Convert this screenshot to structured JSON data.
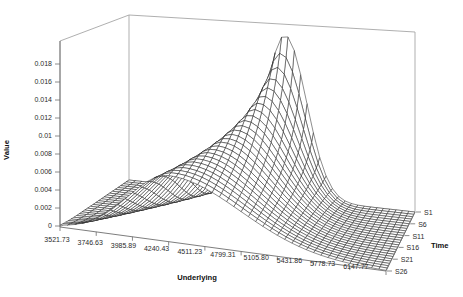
{
  "colors": {
    "background": "#ffffff",
    "mesh_line": "#1c1c1c",
    "mesh_fill": "#ffffff",
    "box_line": "#a6a6a6",
    "axis_line": "#6e6e6e",
    "tick_text": "#2b2b2b",
    "title_text": "#111111"
  },
  "chart_data": {
    "type": "surface",
    "subtype": "3d-wireframe-ridge",
    "x_axis": {
      "label": "Underlying",
      "tick_labels": [
        "3521.73",
        "3746.63",
        "3985.89",
        "4240.43",
        "4511.23",
        "4799.31",
        "5105.80",
        "5431.86",
        "5778.73",
        "6147.77"
      ]
    },
    "series_axis": {
      "label": "Time",
      "tick_labels": [
        "S1",
        "S6",
        "S11",
        "S16",
        "S21",
        "S26"
      ],
      "total_series": 26,
      "front_series": "S26",
      "back_series": "S1"
    },
    "value_axis": {
      "label": "Value",
      "tick_labels": [
        "0",
        "0.002",
        "0.004",
        "0.006",
        "0.008",
        "0.01",
        "0.012",
        "0.014",
        "0.016",
        "0.018"
      ],
      "min": 0,
      "max": 0.02,
      "tick_step": 0.002
    },
    "grid": {
      "n_underlying": 46,
      "n_time": 26
    },
    "surface_model": {
      "type": "asymmetric_gaussian_ridge",
      "peak_value_back": 0.0195,
      "amplitude_decay_per_step": 0.238,
      "center_u_back": 0.545,
      "center_u_front": 0.335,
      "width_left_back": 0.07,
      "width_left_front": 0.125,
      "width_right_back": 0.075,
      "width_right_front": 0.22
    },
    "sampled_values": {
      "underlying": [
        3521.73,
        3746.63,
        3985.89,
        4240.43,
        4511.23,
        4799.31,
        5105.8,
        5431.86,
        5778.73,
        6147.77
      ],
      "rows": [
        {
          "series": "S1",
          "values": [
            0,
            0,
            1e-05,
            0.0002,
            0.00688,
            0.0193,
            0.00519,
            0.00015,
            0,
            0
          ]
        },
        {
          "series": "S6",
          "values": [
            0,
            1e-05,
            3e-05,
            0.00146,
            0.01011,
            0.01157,
            0.0038,
            0.0004,
            1e-05,
            0
          ]
        },
        {
          "series": "S11",
          "values": [
            0,
            1e-05,
            0.00036,
            0.00403,
            0.01043,
            0.00822,
            0.0032,
            0.00062,
            6e-05,
            0
          ]
        },
        {
          "series": "S16",
          "values": [
            0,
            0.0001,
            0.00146,
            0.00644,
            0.00901,
            0.00638,
            0.00283,
            0.00078,
            0.00014,
            1e-05
          ]
        },
        {
          "series": "S21",
          "values": [
            3e-05,
            0.00053,
            0.00322,
            0.00754,
            0.00764,
            0.00524,
            0.00257,
            0.0009,
            0.00022,
            4e-05
          ]
        },
        {
          "series": "S26",
          "values": [
            0.0002,
            0.00149,
            0.00492,
            0.0074,
            0.00655,
            0.00447,
            0.00237,
            0.00097,
            0.00031,
            8e-05
          ]
        }
      ]
    }
  }
}
